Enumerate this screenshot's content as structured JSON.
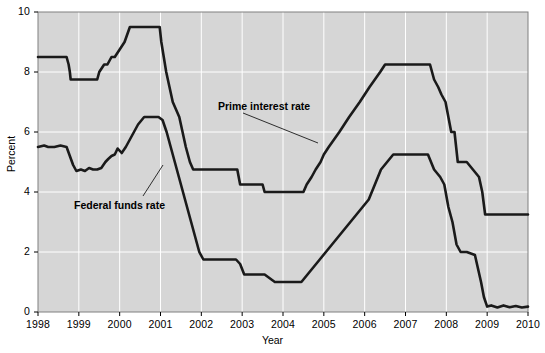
{
  "chart_data": {
    "type": "line",
    "title": "",
    "xlabel": "Year",
    "ylabel": "Percent",
    "xlim": [
      1998,
      2010
    ],
    "ylim": [
      0,
      10
    ],
    "ytick_labels": [
      "0",
      "2",
      "4",
      "6",
      "8",
      "10"
    ],
    "yticks": [
      0,
      2,
      4,
      6,
      8,
      10
    ],
    "xtick_labels": [
      "1998",
      "1999",
      "2000",
      "2001",
      "2002",
      "2003",
      "2004",
      "2005",
      "2006",
      "2007",
      "2008",
      "2009",
      "2010"
    ],
    "xticks": [
      1998,
      1999,
      2000,
      2001,
      2002,
      2003,
      2004,
      2005,
      2006,
      2007,
      2008,
      2009,
      2010
    ],
    "grid": true,
    "grid_color": "#ffffff",
    "plot_bgcolor": "#d6d6d6",
    "line_color": "#1a1a1a",
    "legend_position": "inline-annotations",
    "series": [
      {
        "name": "Prime interest rate",
        "annotation": "Prime interest rate",
        "x": [
          1998.0,
          1998.7,
          1998.75,
          1998.78,
          1998.8,
          1998.84,
          1998.88,
          1998.92,
          1999.45,
          1999.5,
          1999.62,
          1999.7,
          1999.8,
          1999.88,
          2000.0,
          2000.12,
          2000.25,
          2000.3,
          2000.38,
          2000.45,
          2000.98,
          2001.02,
          2001.08,
          2001.14,
          2001.22,
          2001.3,
          2001.38,
          2001.46,
          2001.54,
          2001.62,
          2001.72,
          2001.8,
          2001.88,
          2001.95,
          2002.0,
          2002.88,
          2002.95,
          2003.0,
          2003.5,
          2003.55,
          2004.0,
          2004.5,
          2004.58,
          2004.7,
          2004.8,
          2004.92,
          2005.0,
          2005.12,
          2005.25,
          2005.38,
          2005.5,
          2005.62,
          2005.75,
          2005.88,
          2006.0,
          2006.12,
          2006.25,
          2006.38,
          2006.5,
          2007.0,
          2007.6,
          2007.7,
          2007.8,
          2007.88,
          2007.98,
          2008.05,
          2008.12,
          2008.2,
          2008.28,
          2008.36,
          2008.5,
          2008.8,
          2008.88,
          2008.95,
          2009.0,
          2010.0
        ],
        "y": [
          8.5,
          8.5,
          8.25,
          8.0,
          7.75,
          7.75,
          7.75,
          7.75,
          7.75,
          8.0,
          8.25,
          8.25,
          8.5,
          8.5,
          8.75,
          9.0,
          9.5,
          9.5,
          9.5,
          9.5,
          9.5,
          9.0,
          8.5,
          8.0,
          7.5,
          7.0,
          6.75,
          6.5,
          6.0,
          5.5,
          5.0,
          4.75,
          4.75,
          4.75,
          4.75,
          4.75,
          4.25,
          4.25,
          4.25,
          4.0,
          4.0,
          4.0,
          4.25,
          4.5,
          4.75,
          5.0,
          5.25,
          5.5,
          5.75,
          6.0,
          6.25,
          6.5,
          6.75,
          7.0,
          7.25,
          7.5,
          7.75,
          8.0,
          8.25,
          8.25,
          8.25,
          7.75,
          7.5,
          7.25,
          7.0,
          6.5,
          6.0,
          6.0,
          5.0,
          5.0,
          5.0,
          4.5,
          4.0,
          3.25,
          3.25,
          3.25
        ],
        "key_values": {
          "1998_start": 8.5,
          "1998_low": 7.75,
          "2000_peak": 9.5,
          "2002_2004_trough": 4.0,
          "2006_2007_plateau": 8.25,
          "2009_2010_floor": 3.25
        }
      },
      {
        "name": "Federal funds rate",
        "annotation": "Federal funds rate",
        "x": [
          1998.0,
          1998.15,
          1998.25,
          1998.4,
          1998.55,
          1998.7,
          1998.78,
          1998.86,
          1998.94,
          1999.05,
          1999.15,
          1999.25,
          1999.35,
          1999.45,
          1999.55,
          1999.65,
          1999.72,
          1999.8,
          1999.88,
          1999.95,
          2000.05,
          2000.15,
          2000.25,
          2000.35,
          2000.45,
          2000.6,
          2000.8,
          2000.95,
          2001.05,
          2001.15,
          2001.25,
          2001.35,
          2001.45,
          2001.55,
          2001.65,
          2001.75,
          2001.85,
          2001.95,
          2002.05,
          2002.4,
          2002.85,
          2002.95,
          2003.05,
          2003.4,
          2003.55,
          2003.8,
          2004.0,
          2004.45,
          2004.6,
          2004.75,
          2004.9,
          2005.05,
          2005.2,
          2005.35,
          2005.5,
          2005.65,
          2005.8,
          2005.95,
          2006.1,
          2006.25,
          2006.4,
          2006.55,
          2006.7,
          2007.0,
          2007.55,
          2007.7,
          2007.85,
          2007.95,
          2008.05,
          2008.15,
          2008.25,
          2008.35,
          2008.5,
          2008.7,
          2008.85,
          2008.92,
          2009.0,
          2009.1,
          2009.25,
          2009.4,
          2009.55,
          2009.7,
          2009.85,
          2010.0
        ],
        "y": [
          5.5,
          5.55,
          5.5,
          5.5,
          5.55,
          5.5,
          5.2,
          4.9,
          4.7,
          4.75,
          4.7,
          4.8,
          4.75,
          4.75,
          4.8,
          5.0,
          5.1,
          5.2,
          5.25,
          5.45,
          5.3,
          5.5,
          5.75,
          6.0,
          6.25,
          6.5,
          6.5,
          6.5,
          6.4,
          6.0,
          5.5,
          5.0,
          4.5,
          4.0,
          3.5,
          3.0,
          2.5,
          2.0,
          1.75,
          1.75,
          1.75,
          1.6,
          1.25,
          1.25,
          1.25,
          1.0,
          1.0,
          1.0,
          1.25,
          1.5,
          1.75,
          2.0,
          2.25,
          2.5,
          2.75,
          3.0,
          3.25,
          3.5,
          3.75,
          4.25,
          4.75,
          5.0,
          5.25,
          5.25,
          5.25,
          4.75,
          4.5,
          4.25,
          3.5,
          3.0,
          2.25,
          2.0,
          2.0,
          1.9,
          1.0,
          0.5,
          0.18,
          0.22,
          0.15,
          0.22,
          0.16,
          0.2,
          0.15,
          0.18
        ],
        "key_values": {
          "1998_start": 5.5,
          "1998_low": 4.7,
          "2000_peak": 6.5,
          "2003_2004_trough": 1.0,
          "2006_2007_plateau": 5.25,
          "2009_2010_floor": 0.2
        }
      }
    ]
  }
}
